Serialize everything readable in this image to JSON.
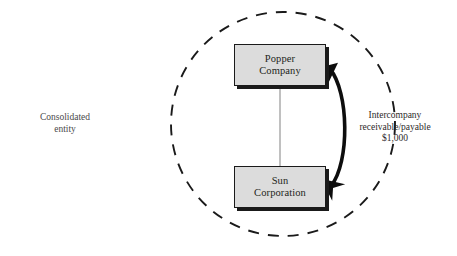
{
  "diagram": {
    "background_color": "#ffffff",
    "boundary": {
      "name": "consolidated-entity-boundary",
      "shape": "dashed-circle",
      "label": "Consolidated\nentity",
      "center_x": 283,
      "center_y": 124,
      "radius": 112,
      "stroke_color": "#1a1a1a",
      "dash_pattern": "11 9"
    },
    "nodes": [
      {
        "id": "popper",
        "name": "popper-company-node",
        "label": "Popper\nCompany",
        "fill_color": "#dcdcdc",
        "border_color": "#1a1a1a",
        "shadow_color": "#1a1a1a",
        "x": 234,
        "y": 44,
        "width": 92,
        "height": 42
      },
      {
        "id": "sun",
        "name": "sun-corporation-node",
        "label": "Sun\nCorporation",
        "fill_color": "#dcdcdc",
        "border_color": "#1a1a1a",
        "shadow_color": "#1a1a1a",
        "x": 234,
        "y": 166,
        "width": 92,
        "height": 42
      }
    ],
    "connectors": [
      {
        "id": "ownership-line",
        "name": "ownership-connector",
        "type": "straight-line",
        "from": "popper",
        "to": "sun",
        "stroke_color": "#8c8c8c",
        "stroke_width": 1,
        "arrowheads": "none"
      },
      {
        "id": "intercompany-arrow",
        "name": "intercompany-double-arrow",
        "type": "curved-double-arrow",
        "from": "popper",
        "to": "sun",
        "stroke_color": "#0d0d0d",
        "stroke_width": 4,
        "arrowheads": "both",
        "label": "Intercompany\nreceivable/payable\n$1,000"
      }
    ],
    "labels": {
      "consolidated_entity": "Consolidated\nentity",
      "intercompany": "Intercompany\nreceivable/payable\n$1,000",
      "intercompany_amount": "$1,000"
    }
  }
}
